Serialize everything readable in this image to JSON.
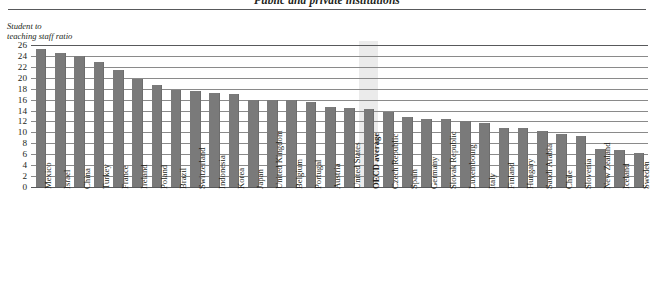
{
  "title": "Public and private institutions",
  "axis_caption": "Student to\nteaching staff ratio",
  "colors": {
    "bar": "#7a7a7a",
    "gridline": "#8a8a8a",
    "rule": "#58595b",
    "highlight_band": "#e8e8e8",
    "text": "#231f20"
  },
  "chart_data": {
    "type": "bar",
    "title": "Public and private institutions",
    "xlabel": "",
    "ylabel": "Student to teaching staff ratio",
    "ylim": [
      0,
      26
    ],
    "yticks": [
      0,
      2,
      4,
      6,
      8,
      10,
      12,
      14,
      16,
      18,
      20,
      22,
      24,
      26
    ],
    "grid": true,
    "legend": null,
    "highlight_category": "OECD average",
    "categories": [
      "Mexico",
      "Israel",
      "China",
      "Turkey",
      "France",
      "Ireland",
      "Poland",
      "Brazil",
      "Switzerland",
      "Indonesia",
      "Korea",
      "Japan",
      "United Kingdom",
      "Belgium",
      "Portugal",
      "Austria",
      "United States",
      "OECD average",
      "Czech Republic",
      "Spain",
      "Germany",
      "Slovak Republic",
      "Luxembourg",
      "Italy",
      "Finland",
      "Hungary",
      "Saudi Arabia",
      "Chile",
      "Slovenia",
      "New Zealand",
      "Iceland",
      "Sweden"
    ],
    "values": [
      25.3,
      24.6,
      24.0,
      22.9,
      21.5,
      19.7,
      18.6,
      17.7,
      17.5,
      17.3,
      17.0,
      15.9,
      15.9,
      15.9,
      15.6,
      14.6,
      14.5,
      14.3,
      13.8,
      12.8,
      12.5,
      12.4,
      12.0,
      11.8,
      10.8,
      10.8,
      10.2,
      9.7,
      9.4,
      6.9,
      6.8,
      6.2
    ]
  }
}
